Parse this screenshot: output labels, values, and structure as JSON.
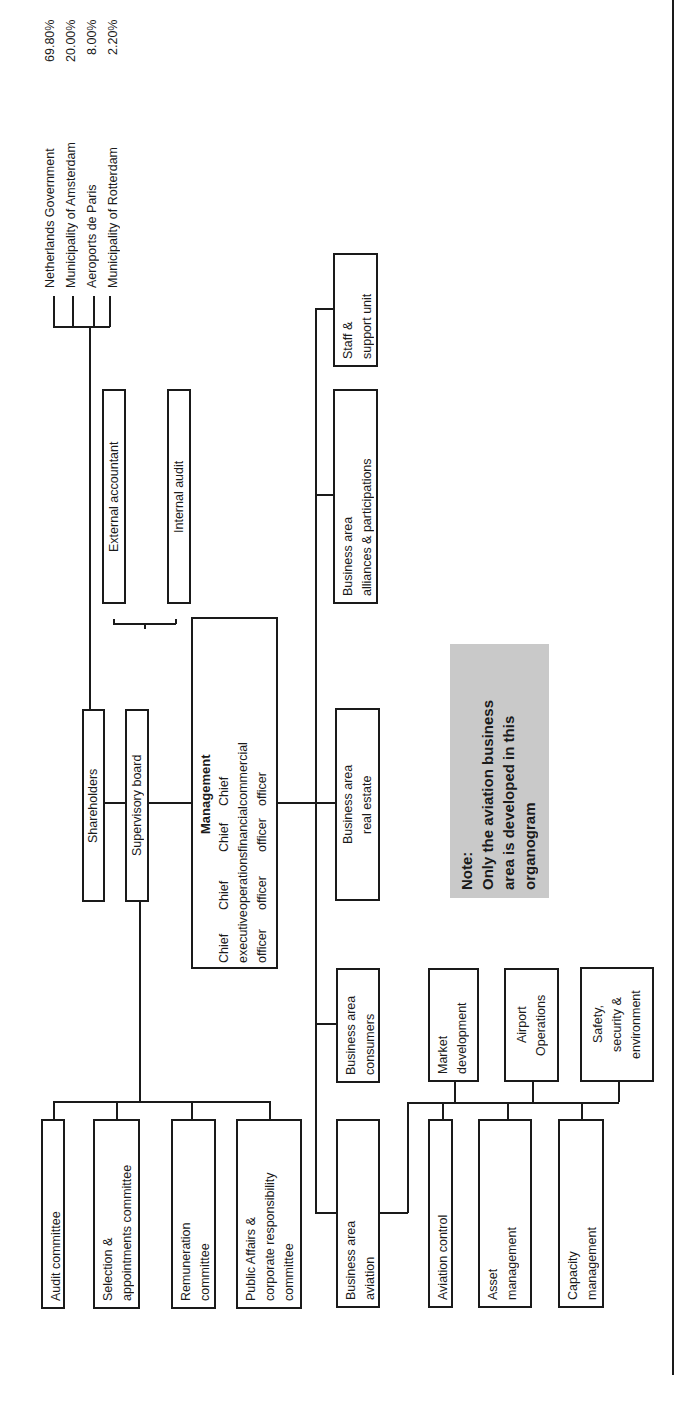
{
  "shareholders": {
    "items": [
      {
        "name": "Netherlands Government",
        "share": "69.80%"
      },
      {
        "name": "Municipality of Amsterdam",
        "share": "20.00%"
      },
      {
        "name": "Aeroports de Paris",
        "share": "8.00%"
      },
      {
        "name": "Municipality of Rotterdam",
        "share": "2.20%"
      }
    ]
  },
  "nodes": {
    "shareholders": "Shareholders",
    "supervisory_board": "Supervisory board",
    "external_accountant": "External accountant",
    "internal_audit": "Internal audit",
    "committees": [
      {
        "lines": [
          "Audit committee"
        ]
      },
      {
        "lines": [
          "Selection &",
          "appointments committee"
        ]
      },
      {
        "lines": [
          "Remuneration",
          "committee"
        ]
      },
      {
        "lines": [
          "Public Affairs &",
          "corporate responsibility",
          "committee"
        ]
      }
    ],
    "management": {
      "title": "Management",
      "officers": [
        [
          "Chief",
          "executive",
          "officer"
        ],
        [
          "Chief",
          "operations",
          "officer"
        ],
        [
          "Chief",
          "financial",
          "officer"
        ],
        [
          "Chief",
          "commercial",
          "officer"
        ]
      ]
    },
    "business_areas": {
      "aviation": [
        "Business area",
        "aviation"
      ],
      "consumers": [
        "Business area",
        "consumers"
      ],
      "real_estate": [
        "Business area",
        "real estate"
      ],
      "alliances": [
        "Business area",
        "alliances & participations"
      ],
      "staff": [
        "Staff &",
        "support unit"
      ]
    },
    "aviation_units": {
      "aviation_control": [
        "Aviation control"
      ],
      "asset_management": [
        "Asset",
        "management"
      ],
      "capacity_management": [
        "Capacity",
        "management"
      ],
      "market_development": [
        "Market",
        "development"
      ],
      "airport_operations": [
        "Airport",
        "Operations"
      ],
      "safety": [
        "Safety,",
        "security &",
        "environment"
      ]
    }
  },
  "note": {
    "lines": [
      "Note:",
      "Only the aviation business",
      "area is developed in this",
      "organogram"
    ],
    "background": "#c9c9c9"
  }
}
